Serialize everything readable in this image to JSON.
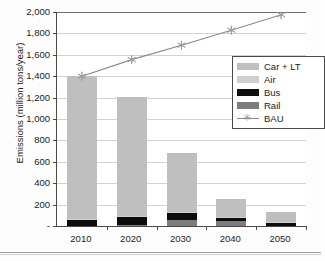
{
  "chart_data": {
    "type": "bar",
    "subtype": "stacked-column-with-line-overlay",
    "title": "",
    "xlabel": "",
    "ylabel": "Emissions (million tons/year)",
    "categories": [
      "2010",
      "2020",
      "2030",
      "2040",
      "2050"
    ],
    "ylim": [
      0,
      2000
    ],
    "ytick_values": [
      0,
      200,
      400,
      600,
      800,
      1000,
      1200,
      1400,
      1600,
      1800,
      2000
    ],
    "ytick_labels": [
      "-",
      "200",
      "400",
      "600",
      "800",
      "1,000",
      "1,200",
      "1,400",
      "1,600",
      "1,800",
      "2,000"
    ],
    "grid": "horizontal",
    "legend_position": "upper-right-inside",
    "series": [
      {
        "name": "Car + LT",
        "kind": "bar-stack",
        "color": "#bfbfbf",
        "values": [
          1330,
          1115,
          555,
          170,
          90
        ]
      },
      {
        "name": "Air",
        "kind": "bar-stack",
        "color": "#cfcfcf",
        "values": [
          8,
          8,
          5,
          5,
          3
        ]
      },
      {
        "name": "Bus",
        "kind": "bar-stack",
        "color": "#0d0d0d",
        "values": [
          62,
          75,
          65,
          35,
          37
        ]
      },
      {
        "name": "Rail",
        "kind": "bar-stack",
        "color": "#7d7d7d",
        "values": [
          0,
          12,
          60,
          45,
          0
        ]
      },
      {
        "name": "BAU",
        "kind": "line",
        "color": "#8a8a8a",
        "marker": "asterisk",
        "values": [
          1400,
          1555,
          1690,
          1830,
          1975
        ]
      }
    ],
    "bar_totals": [
      1400,
      1210,
      685,
      255,
      130
    ]
  },
  "legend": {
    "items": [
      {
        "label": "Car + LT",
        "swatch": "carlt"
      },
      {
        "label": "Air",
        "swatch": "air"
      },
      {
        "label": "Bus",
        "swatch": "bus"
      },
      {
        "label": "Rail",
        "swatch": "rail"
      },
      {
        "label": "BAU",
        "swatch": "line"
      }
    ]
  }
}
